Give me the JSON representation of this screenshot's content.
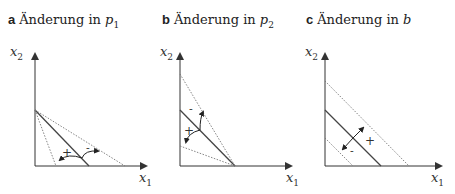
{
  "panels": [
    {
      "letter": "a",
      "title": "Änderung in ",
      "var": "p",
      "var_sub": "1",
      "y_axis": {
        "label": "x",
        "sub": "2"
      },
      "x_axis": {
        "label": "x",
        "sub": "1"
      },
      "signs": {
        "plus": "+",
        "minus": "-"
      }
    },
    {
      "letter": "b",
      "title": "Änderung in ",
      "var": "p",
      "var_sub": "2",
      "y_axis": {
        "label": "x",
        "sub": "2"
      },
      "x_axis": {
        "label": "x",
        "sub": "1"
      },
      "signs": {
        "plus": "+",
        "minus": "-"
      }
    },
    {
      "letter": "c",
      "title": "Änderung in ",
      "var": "b",
      "var_sub": "",
      "y_axis": {
        "label": "x",
        "sub": "2"
      },
      "x_axis": {
        "label": "x",
        "sub": "1"
      },
      "signs": {
        "plus": "+",
        "minus": "-"
      }
    }
  ],
  "colors": {
    "axis": "#333333",
    "solid_line": "#444444",
    "dotted_line": "#777777"
  }
}
